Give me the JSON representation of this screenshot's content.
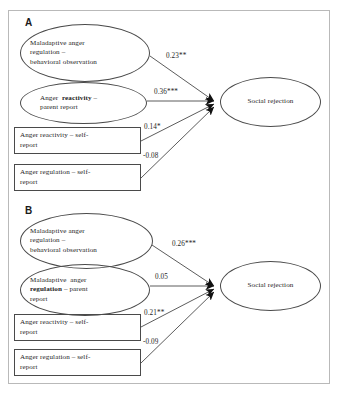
{
  "figure": {
    "panels": [
      {
        "id": "A",
        "label": "A",
        "predictors": [
          {
            "shape": "ellipse",
            "name": "maladaptive-anger-regulation-behavioral-observation",
            "lines": [
              "Maladaptive  anger",
              "regulation –",
              "behavioral  observation"
            ],
            "bold_word": ""
          },
          {
            "shape": "ellipse",
            "name": "anger-reactivity-parent-report",
            "lines": [
              "Anger  reactivity –",
              "parent report"
            ],
            "bold_word": "reactivity"
          },
          {
            "shape": "rect",
            "name": "anger-reactivity-self-report",
            "lines": [
              "Anger  reactivity  – self-",
              "report"
            ],
            "bold_word": ""
          },
          {
            "shape": "rect",
            "name": "anger-regulation-self-report",
            "lines": [
              "Anger  regulation  – self-",
              "report"
            ],
            "bold_word": ""
          }
        ],
        "outcome": {
          "name": "social-rejection",
          "label": "Social rejection"
        },
        "coefficients": [
          "0.23**",
          "0.36***",
          "0.14*",
          "-0.08"
        ]
      },
      {
        "id": "B",
        "label": "B",
        "predictors": [
          {
            "shape": "ellipse",
            "name": "maladaptive-anger-regulation-behavioral-observation",
            "lines": [
              "Maladaptive  anger",
              "regulation –",
              "behavioral  observation"
            ],
            "bold_word": ""
          },
          {
            "shape": "ellipse",
            "name": "maladaptive-anger-regulation-parent-report",
            "lines": [
              "Maladaptive  anger",
              "regulation – parent",
              "report"
            ],
            "bold_word": "regulation"
          },
          {
            "shape": "rect",
            "name": "anger-reactivity-self-report",
            "lines": [
              "Anger  reactivity  – self-",
              "report"
            ],
            "bold_word": ""
          },
          {
            "shape": "rect",
            "name": "anger-regulation-self-report",
            "lines": [
              "Anger  regulation  – self-",
              "report"
            ],
            "bold_word": ""
          }
        ],
        "outcome": {
          "name": "social-rejection",
          "label": "Social rejection"
        },
        "coefficients": [
          "0.26***",
          "0.05",
          "0.21**",
          "-0.09"
        ]
      }
    ],
    "colors": {
      "stroke": "#4a4a4a",
      "text": "#1d1d1d",
      "frame": "#b9b9b9"
    }
  }
}
